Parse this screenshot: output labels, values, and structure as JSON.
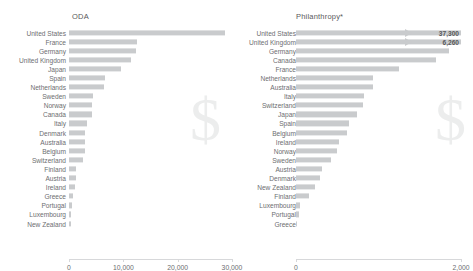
{
  "figure": {
    "watermark_glyph": "$",
    "bar_color": "#c9cbcd",
    "text_color": "#6d6e71",
    "axis_color": "#d7d8da"
  },
  "panels": {
    "left": {
      "title": "ODA",
      "axis_ticks": [
        "0",
        "10,000",
        "20,000",
        "30,000"
      ]
    },
    "right": {
      "title": "Philanthropy*",
      "axis_ticks": [
        "0",
        "2,000"
      ]
    }
  },
  "chart_data": [
    {
      "type": "bar",
      "orientation": "horizontal",
      "title": "ODA",
      "xlabel": "",
      "ylabel": "",
      "xlim": [
        0,
        30000
      ],
      "xticks": [
        0,
        10000,
        20000,
        30000
      ],
      "xticklabels": [
        "0",
        "10,000",
        "20,000",
        "30,000"
      ],
      "grid": false,
      "legend": "none",
      "categories": [
        "United States",
        "France",
        "Germany",
        "United Kingdom",
        "Japan",
        "Spain",
        "Netherlands",
        "Sweden",
        "Norway",
        "Canada",
        "Italy",
        "Denmark",
        "Australia",
        "Belgium",
        "Switzerland",
        "Finland",
        "Austria",
        "Ireland",
        "Greece",
        "Portugal",
        "Luxembourg",
        "New Zealand"
      ],
      "values": [
        28800,
        12600,
        12300,
        11400,
        9500,
        6600,
        6400,
        4500,
        4300,
        4200,
        3400,
        3000,
        2950,
        2900,
        2600,
        1350,
        1250,
        1050,
        650,
        600,
        450,
        400
      ],
      "data_labels": [
        "",
        "",
        "",
        "",
        "",
        "",
        "",
        "",
        "",
        "",
        "",
        "",
        "",
        "",
        "",
        "",
        "",
        "",
        "",
        "",
        "",
        ""
      ]
    },
    {
      "type": "bar",
      "orientation": "horizontal",
      "title": "Philanthropy*",
      "xlabel": "",
      "ylabel": "",
      "xlim": [
        0,
        2000
      ],
      "xticks": [
        0,
        2000
      ],
      "xticklabels": [
        "0",
        "2,000"
      ],
      "grid": false,
      "legend": "none",
      "categories": [
        "United States",
        "United Kingdom",
        "Germany",
        "Canada",
        "France",
        "Netherlands",
        "Australia",
        "Italy",
        "Switzerland",
        "Japan",
        "Spain",
        "Belgium",
        "Ireland",
        "Norway",
        "Sweden",
        "Austria",
        "Denmark",
        "New Zealand",
        "Finland",
        "Luxembourg",
        "Portugal",
        "Greece"
      ],
      "values": [
        37300,
        6260,
        1850,
        1700,
        1250,
        930,
        930,
        830,
        810,
        740,
        640,
        620,
        520,
        500,
        420,
        310,
        290,
        230,
        160,
        45,
        35,
        15
      ],
      "data_labels": [
        "37,300",
        "6,260",
        "",
        "",
        "",
        "",
        "",
        "",
        "",
        "",
        "",
        "",
        "",
        "",
        "",
        "",
        "",
        "",
        "",
        "",
        "",
        ""
      ],
      "overflow_bars": [
        0,
        1
      ]
    }
  ]
}
